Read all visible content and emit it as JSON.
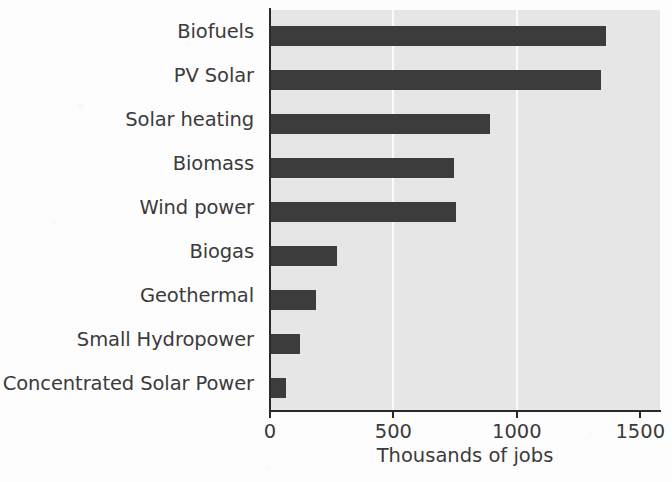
{
  "chart_data": {
    "type": "bar",
    "orientation": "horizontal",
    "title": "",
    "subtitle": "",
    "xlabel": "Thousands of jobs",
    "ylabel": "",
    "categories": [
      "Biofuels",
      "PV Solar",
      "Solar heating",
      "Biomass",
      "Wind power",
      "Biogas",
      "Geothermal",
      "Small Hydropower",
      "Concentrated Solar Power"
    ],
    "values": [
      1360,
      1340,
      890,
      745,
      755,
      270,
      185,
      120,
      65
    ],
    "xlim": [
      0,
      1580
    ],
    "xticks": [
      0,
      500,
      1000,
      1500
    ],
    "xtick_labels": [
      "0",
      "500",
      "1000",
      "1500"
    ],
    "gridlines": [
      500,
      1000
    ],
    "grid": true,
    "legend": false,
    "legend_position": "none",
    "colors": {
      "bar": "#3c3c3c",
      "panel_background": "#e6e6e6",
      "gridline": "#fafafa",
      "axis": "#2a2a2a",
      "text": "#3b3b3b",
      "page_background": "#fdfdfd"
    }
  }
}
